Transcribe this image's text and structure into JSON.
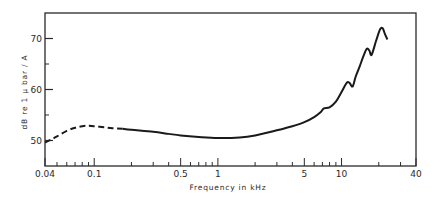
{
  "chart_data": {
    "type": "line",
    "title": "",
    "xlabel": "Frequency  in  kHz",
    "ylabel": "dB  re  1  μ bar / A",
    "xscale": "log",
    "xlim": [
      0.04,
      40
    ],
    "ylim": [
      45,
      75
    ],
    "grid": false,
    "legend": null,
    "x_tick_labels": [
      "0.04",
      "0.1",
      "0.5",
      "1",
      "5",
      "10",
      "40"
    ],
    "x_ticks": [
      0.04,
      0.1,
      0.5,
      1,
      5,
      10,
      40
    ],
    "x_minor_ticks": [
      0.05,
      0.06,
      0.07,
      0.08,
      0.09,
      0.2,
      0.3,
      0.4,
      0.6,
      0.7,
      0.8,
      0.9,
      2,
      3,
      4,
      6,
      7,
      8,
      9,
      20,
      30
    ],
    "y_tick_labels": [
      "50",
      "60",
      "70"
    ],
    "y_ticks": [
      50,
      60,
      70
    ],
    "y_minor_ticks": [
      55,
      65
    ],
    "series": [
      {
        "name": "response (dashed, low-frequency extrapolation)",
        "style": "dashed",
        "x": [
          0.04,
          0.045,
          0.05,
          0.06,
          0.07,
          0.08,
          0.09,
          0.1,
          0.12,
          0.14,
          0.17
        ],
        "y": [
          49.6,
          50.2,
          50.8,
          51.9,
          52.5,
          52.8,
          52.9,
          52.8,
          52.6,
          52.4,
          52.3
        ]
      },
      {
        "name": "response (solid, measured)",
        "style": "solid",
        "x": [
          0.17,
          0.2,
          0.3,
          0.4,
          0.5,
          0.7,
          1,
          1.5,
          2,
          3,
          4,
          5,
          6,
          6.8,
          7.2,
          8,
          9,
          10,
          11,
          11.6,
          12.3,
          13,
          14,
          15,
          16,
          16.8,
          17.5,
          19,
          20.5,
          21.5,
          22.5,
          23.5
        ],
        "y": [
          52.3,
          52.1,
          51.7,
          51.3,
          51.0,
          50.7,
          50.5,
          50.6,
          51.0,
          52.0,
          52.8,
          53.6,
          54.6,
          55.6,
          56.3,
          56.5,
          57.6,
          59.5,
          61.3,
          61.3,
          60.6,
          62.5,
          64.5,
          66.5,
          68.0,
          67.6,
          66.8,
          69.5,
          71.8,
          72.0,
          70.8,
          69.8
        ]
      }
    ]
  }
}
